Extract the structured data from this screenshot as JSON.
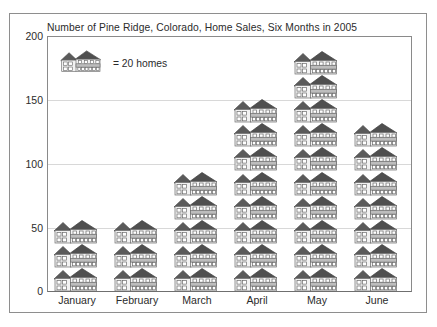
{
  "chart_data": {
    "type": "bar",
    "subtype": "pictograph",
    "title": "Number of Pine Ridge, Colorado, Home Sales, Six Months in 2005",
    "xlabel": "",
    "ylabel": "",
    "ylim": [
      0,
      200
    ],
    "yticks": [
      0,
      50,
      100,
      150,
      200
    ],
    "ytick_labels": [
      "0",
      "50",
      "100",
      "150",
      "200"
    ],
    "grid": true,
    "grid_axis": "y",
    "legend": {
      "position": "inside-top-left",
      "icon": "house-icon",
      "text": "= 20 homes",
      "unit_value": 20,
      "unit_label": "homes"
    },
    "categories": [
      "January",
      "February",
      "March",
      "April",
      "May",
      "June"
    ],
    "values": [
      60,
      60,
      95,
      155,
      190,
      135
    ],
    "icon_counts": [
      3,
      3,
      5,
      8,
      10,
      7
    ],
    "icon_unit": 20,
    "series": [
      {
        "name": "Home Sales",
        "values": [
          60,
          60,
          95,
          155,
          190,
          135
        ]
      }
    ]
  },
  "colors": {
    "frame": "#8e8e8e",
    "axis": "#8a8a8a",
    "gridline": "#d8d8d8",
    "text": "#2b2b2b",
    "house_roof": "#555555",
    "house_wall": "#f0f0f0",
    "house_band": "#b9b9b9",
    "house_outline": "#6d6d6d",
    "background": "#ffffff"
  },
  "icons": {
    "house": "house-icon"
  }
}
